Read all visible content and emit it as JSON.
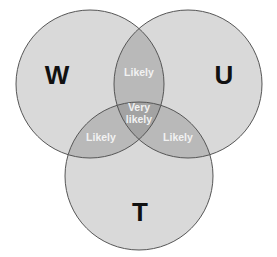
{
  "diagram": {
    "type": "venn-3",
    "sets": [
      {
        "label": "W",
        "cx": 90,
        "cy": 84,
        "r": 74
      },
      {
        "label": "U",
        "cx": 188,
        "cy": 84,
        "r": 74
      },
      {
        "label": "T",
        "cx": 139,
        "cy": 176,
        "r": 74
      }
    ],
    "intersections": {
      "W_U": "Likely",
      "W_T": "Likely",
      "U_T": "Likely",
      "W_U_T_line1": "Very",
      "W_U_T_line2": "likely"
    },
    "colors": {
      "single": "#d9d9d9",
      "double": "#b9b9b9",
      "triple": "#a3a3a3",
      "stroke": "#555555"
    }
  }
}
